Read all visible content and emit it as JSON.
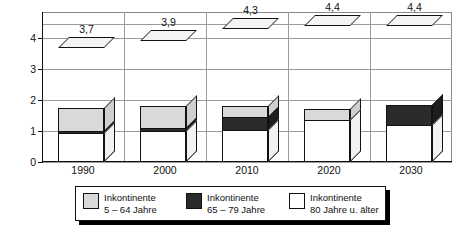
{
  "chart_data": {
    "type": "bar",
    "subtype": "stacked-3d-column",
    "title": "",
    "xlabel": "",
    "ylabel": "in Millionen",
    "categories": [
      "1990",
      "2000",
      "2010",
      "2020",
      "2030"
    ],
    "ylim": [
      0,
      4.85
    ],
    "yticks": [
      0,
      1,
      2,
      3,
      4
    ],
    "ytick_labels": [
      "0",
      "1",
      "2",
      "3",
      "4"
    ],
    "grid": true,
    "legend_position": "bottom",
    "decimal_separator": ",",
    "series": [
      {
        "name": "Inkontinente 5 – 64 Jahre",
        "color": "#d9d9d9",
        "values": [
          1.75,
          1.8,
          1.8,
          1.7,
          1.35
        ]
      },
      {
        "name": "Inkontinente 65 – 79 Jahre",
        "color": "#2b2b2b",
        "values": [
          1.0,
          1.1,
          1.45,
          1.35,
          1.85
        ]
      },
      {
        "name": "Inkontinente 80 Jahre u. älter",
        "color": "#ffffff",
        "values": [
          0.95,
          1.0,
          1.05,
          1.35,
          1.2
        ]
      }
    ],
    "totals": [
      3.7,
      3.9,
      4.3,
      4.4,
      4.4
    ],
    "total_labels": [
      "3,7",
      "3,9",
      "4,3",
      "4,4",
      "4,4"
    ]
  },
  "axis": {
    "y_title": "in Millionen",
    "y_tick_labels": [
      "4",
      "3",
      "2",
      "1",
      "0"
    ],
    "x_tick_labels": [
      "1990",
      "2000",
      "2010",
      "2020",
      "2030"
    ]
  },
  "bar_labels": [
    "3,7",
    "3,9",
    "4,3",
    "4,4",
    "4,4"
  ],
  "legend": {
    "items": [
      {
        "swatch": "light-gray",
        "line1": "Inkontinente",
        "line2": "5 – 64 Jahre"
      },
      {
        "swatch": "dark",
        "line1": "Inkontinente",
        "line2": "65 – 79 Jahre"
      },
      {
        "swatch": "white",
        "line1": "Inkontinente",
        "line2": "80 Jahre u. älter"
      }
    ]
  },
  "colors": {
    "segment_low": "#d9d9d9",
    "segment_mid": "#2b2b2b",
    "segment_high": "#ffffff",
    "axis": "#111111",
    "grid": "#9b9b9b"
  }
}
